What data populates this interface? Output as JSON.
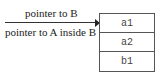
{
  "labels": {
    "pointer_b": "pointer to B",
    "pointer_a": "pointer to A inside B"
  },
  "memory_block": {
    "cells": [
      "a1",
      "a2",
      "b1"
    ]
  }
}
